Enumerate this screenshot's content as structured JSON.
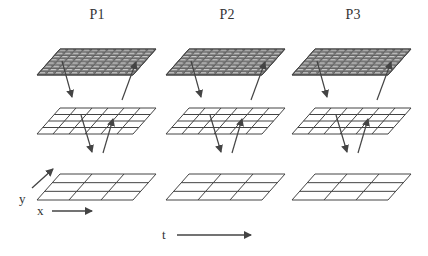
{
  "diagram": {
    "panels": [
      {
        "label": "P1",
        "offset_x": 0
      },
      {
        "label": "P2",
        "offset_x": 129
      },
      {
        "label": "P3",
        "offset_x": 255
      }
    ],
    "levels": [
      {
        "name": "fine",
        "cols": 12,
        "rows": 8,
        "fill": "#8a8a8a",
        "top_y": 49,
        "bottom_y": 75
      },
      {
        "name": "medium",
        "cols": 6,
        "rows": 4,
        "fill": "#ffffff",
        "top_y": 108,
        "bottom_y": 134
      },
      {
        "name": "coarse",
        "cols": 3,
        "rows": 3,
        "fill": "#ffffff",
        "top_y": 174,
        "bottom_y": 200
      }
    ],
    "axes": {
      "y_label": "y",
      "x_label": "x",
      "time_label": "t"
    },
    "colors": {
      "line": "#444444",
      "fine_fill": "#8a8a8a",
      "arrow": "#444444"
    }
  }
}
